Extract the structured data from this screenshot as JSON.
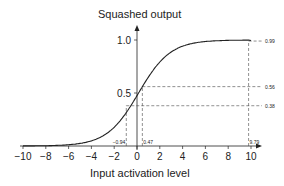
{
  "chart_data": {
    "type": "line",
    "title": "",
    "xlabel": "Input activation level",
    "ylabel": "Squashed output",
    "xlim": [
      -10,
      10
    ],
    "ylim": [
      0,
      1
    ],
    "x_ticks": [
      "-10",
      "-8",
      "-6",
      "-4",
      "-2",
      "0",
      "2",
      "4",
      "6",
      "8",
      "10"
    ],
    "y_ticks": [
      "0.5",
      "1.0"
    ],
    "series": [
      {
        "name": "sigmoid",
        "function": "1/(1+exp(-x/2)) approx",
        "x": [
          -10,
          -8,
          -6,
          -4,
          -2,
          0,
          2,
          4,
          6,
          8,
          10
        ],
        "values": [
          0.01,
          0.02,
          0.05,
          0.12,
          0.27,
          0.5,
          0.73,
          0.88,
          0.95,
          0.98,
          0.99
        ]
      }
    ],
    "annotations": [
      {
        "x_label": "-0.94",
        "y_label": "0.38",
        "x": -0.94,
        "y": 0.38
      },
      {
        "x_label": "0.47",
        "y_label": "0.56",
        "x": 0.47,
        "y": 0.56
      },
      {
        "x_label": "9.79",
        "y_label": "0.99",
        "x": 9.79,
        "y": 0.99
      }
    ],
    "grid": false
  }
}
